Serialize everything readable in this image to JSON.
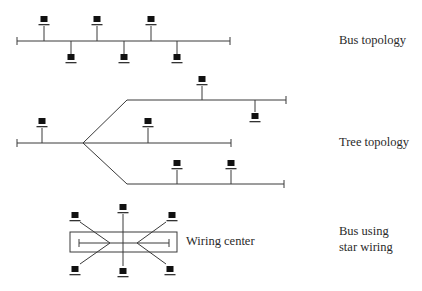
{
  "labels": {
    "bus": "Bus topology",
    "tree": "Tree topology",
    "star_line1": "Bus using",
    "star_line2": "star wiring",
    "wiring_center": "Wiring center"
  },
  "colors": {
    "line": "#3a3a3a",
    "computer": "#111111",
    "background": "#ffffff",
    "text": "#2a2a2a"
  },
  "icons": {
    "node": "computer-terminal-icon"
  },
  "bus_topology": {
    "line": {
      "x1": 17,
      "x2": 230,
      "y": 41
    },
    "nodes_above": [
      44,
      97,
      151
    ],
    "nodes_below": [
      71,
      124,
      177
    ]
  },
  "tree_topology": {
    "trunk": {
      "x1": 17,
      "x2": 83,
      "y": 143
    },
    "branch_point": {
      "x": 83,
      "y": 143
    },
    "branches": [
      {
        "name": "upper",
        "start": [
          127,
          100
        ],
        "end_x": 286
      },
      {
        "name": "middle",
        "start": [
          83,
          143
        ],
        "end_x": 231
      },
      {
        "name": "lower",
        "start": [
          127,
          184
        ],
        "end_x": 284
      }
    ],
    "node_count": 7
  },
  "star_wiring": {
    "wiring_center_box": {
      "x": 70,
      "y": 232,
      "w": 107,
      "h": 20
    },
    "inner_bus": {
      "x1": 79,
      "x2": 169,
      "y": 243
    },
    "node_count": 6
  }
}
